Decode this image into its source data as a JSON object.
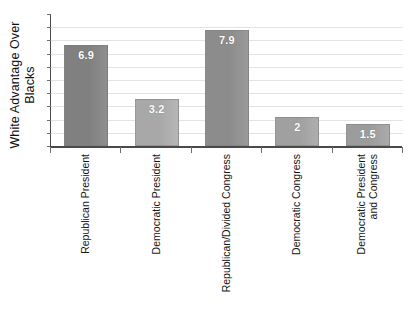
{
  "chart_data": {
    "type": "bar",
    "title": "",
    "xlabel": "",
    "ylabel": "White Advantage Over Blacks",
    "ylabel_lines": [
      "White Advantage Over",
      "Blacks"
    ],
    "categories": [
      "Republican President",
      "Democratic President",
      "Republican/Divided Congress",
      "Democratic Congress",
      "Democratic President and Congress"
    ],
    "category_lines": [
      [
        "Republican President"
      ],
      [
        "Democratic President"
      ],
      [
        "Republican/Divided Congress"
      ],
      [
        "Democratic Congress"
      ],
      [
        "Democratic President",
        "and Congress"
      ]
    ],
    "values": [
      6.9,
      3.2,
      7.9,
      2,
      1.5
    ],
    "value_labels": [
      "6.9",
      "3.2",
      "7.9",
      "2",
      "1.5"
    ],
    "ylim": [
      0,
      9
    ],
    "y_tick_labels": [],
    "gridlines": 9,
    "grid": true,
    "legend": "none",
    "bar_colors": [
      "#808080",
      "#a8a8a8",
      "#8c8c8c",
      "#a0a0a0",
      "#9c9c9c"
    ],
    "grid_color": "#e3e3e3",
    "axis_color": "#4a4a4a",
    "value_label_color": "#ffffff"
  }
}
